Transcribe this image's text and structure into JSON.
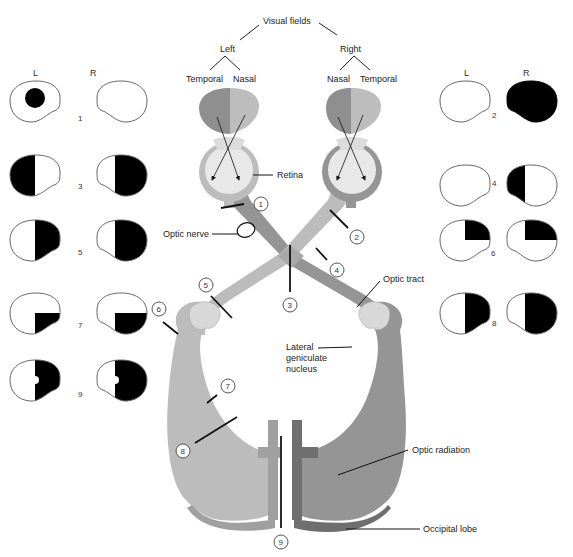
{
  "title": "Visual fields",
  "sides": {
    "left": "Left",
    "right": "Right"
  },
  "left_eye_fields": {
    "temporal": "Temporal",
    "nasal": "Nasal"
  },
  "right_eye_fields": {
    "nasal": "Nasal",
    "temporal": "Temporal"
  },
  "field_columns": {
    "left_eye": "L",
    "right_eye": "R"
  },
  "labels": {
    "retina": "Retina",
    "optic_nerve": "Optic nerve",
    "optic_tract": "Optic tract",
    "lgn_line1": "Lateral",
    "lgn_line2": "geniculate",
    "lgn_line3": "nucleus",
    "optic_radiation": "Optic radiation",
    "occipital_lobe": "Occipital lobe"
  },
  "lesion_markers": [
    "1",
    "2",
    "3",
    "4",
    "5",
    "6",
    "7",
    "8",
    "9"
  ],
  "field_defects": [
    {
      "id": "1",
      "left": "central scotoma",
      "right": "normal"
    },
    {
      "id": "2",
      "left": "normal",
      "right": "complete loss"
    },
    {
      "id": "3",
      "left": "temporal half loss",
      "right": "temporal half loss"
    },
    {
      "id": "4",
      "left": "normal",
      "right": "nasal half loss"
    },
    {
      "id": "5",
      "left": "nasal half loss",
      "right": "temporal half loss"
    },
    {
      "id": "6",
      "left": "upper nasal quadrant loss",
      "right": "upper temporal quadrant loss"
    },
    {
      "id": "7",
      "left": "lower nasal quadrant loss",
      "right": "lower temporal quadrant loss"
    },
    {
      "id": "8",
      "left": "nasal half loss",
      "right": "temporal half loss"
    },
    {
      "id": "9",
      "left": "nasal half loss with macular sparing",
      "right": "temporal half loss with macular sparing"
    }
  ],
  "colors": {
    "field_dark": "#8f8f8f",
    "field_light": "#bdbdbd",
    "left_pathway": "#bcbcbc",
    "right_pathway": "#959595",
    "cortex_dark": "#6f6f6f",
    "eye_fill": "#e6e6e6",
    "defect": "#000000"
  }
}
